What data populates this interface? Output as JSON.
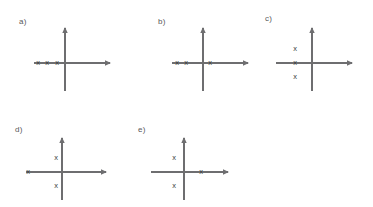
{
  "figure": {
    "axis_color": "#6e6e70",
    "mark_color": "#3a3a3c",
    "label_color": "#58585a",
    "background": "#ffffff",
    "mark_glyph": "x"
  },
  "chart_data": {
    "type": "scatter",
    "title": "",
    "xlabel": "",
    "ylabel": "",
    "grid": false,
    "legend": null,
    "panels": [
      {
        "id": "a",
        "label": "a)",
        "origin": {
          "x": 65,
          "y": 63
        },
        "x_axis": {
          "from": -31,
          "to": 45
        },
        "y_axis": {
          "from": -28,
          "to": -35
        },
        "points": [
          {
            "label": "x",
            "dx": -27,
            "dy": 0
          },
          {
            "label": "x",
            "dx": -18,
            "dy": 0
          },
          {
            "label": "x",
            "dx": -8,
            "dy": 0
          }
        ]
      },
      {
        "id": "b",
        "label": "b)",
        "origin": {
          "x": 203,
          "y": 63
        },
        "x_axis": {
          "from": -31,
          "to": 45
        },
        "y_axis": {
          "from": -28,
          "to": -35
        },
        "points": [
          {
            "label": "x",
            "dx": -26,
            "dy": 0
          },
          {
            "label": "x",
            "dx": -17,
            "dy": 0
          },
          {
            "label": "x",
            "dx": 7,
            "dy": 0
          }
        ]
      },
      {
        "id": "c",
        "label": "c)",
        "origin": {
          "x": 312,
          "y": 63
        },
        "x_axis": {
          "from": -36,
          "to": 40
        },
        "y_axis": {
          "from": -28,
          "to": -35
        },
        "points": [
          {
            "label": "x",
            "dx": -17,
            "dy": -14
          },
          {
            "label": "x",
            "dx": -17,
            "dy": 0
          },
          {
            "label": "x",
            "dx": -17,
            "dy": 14
          }
        ]
      },
      {
        "id": "d",
        "label": "d)",
        "origin": {
          "x": 62,
          "y": 172
        },
        "x_axis": {
          "from": -36,
          "to": 44
        },
        "y_axis": {
          "from": -28,
          "to": -34
        },
        "points": [
          {
            "label": "x",
            "dx": -34,
            "dy": 0
          },
          {
            "label": "x",
            "dx": -6,
            "dy": -14
          },
          {
            "label": "x",
            "dx": -6,
            "dy": 14
          }
        ]
      },
      {
        "id": "e",
        "label": "e)",
        "origin": {
          "x": 184,
          "y": 172
        },
        "x_axis": {
          "from": -33,
          "to": 44
        },
        "y_axis": {
          "from": -28,
          "to": -34
        },
        "points": [
          {
            "label": "x",
            "dx": -10,
            "dy": -14
          },
          {
            "label": "x",
            "dx": -10,
            "dy": 14
          },
          {
            "label": "x",
            "dx": 17,
            "dy": 0
          }
        ]
      }
    ],
    "labels": {
      "a": "a)",
      "b": "b)",
      "c": "c)",
      "d": "d)",
      "e": "e)"
    }
  }
}
